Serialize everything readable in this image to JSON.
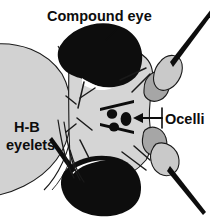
{
  "figure": {
    "type": "anatomical-diagram",
    "background_color": "#ffffff",
    "width": 210,
    "height": 218
  },
  "labels": {
    "compound_eye": "Compound eye",
    "ocelli": "Ocelli",
    "hb_eyelets_line1": "H-B",
    "hb_eyelets_line2": "eyelets"
  },
  "colors": {
    "black": "#0d0d0d",
    "outline": "#1a1a1a",
    "head_light_gray": "#d5d5d5",
    "body_gray": "#d2d2d2",
    "antenna_light": "#c9c9c9",
    "antenna_mid": "#a6a6a6",
    "white": "#ffffff"
  },
  "structures": [
    {
      "name": "posterior-head-mass",
      "fill": "#d2d2d2",
      "description": "large light gray rounded mass occupying the left portion"
    },
    {
      "name": "frons",
      "fill": "#d5d5d5",
      "description": "central light gray head plate between compound eyes"
    },
    {
      "name": "compound-eye-upper",
      "fill": "#0d0d0d",
      "description": "upper black compound eye blob"
    },
    {
      "name": "compound-eye-lower",
      "fill": "#0d0d0d",
      "description": "lower black compound eye blob"
    },
    {
      "name": "ocellus-dot-upper",
      "fill": "#0d0d0d"
    },
    {
      "name": "ocellus-dot-lower",
      "fill": "#0d0d0d"
    },
    {
      "name": "ocellus-dot-median",
      "fill": "#0d0d0d"
    },
    {
      "name": "antenna-upper-pedicel",
      "fill": "#a6a6a6"
    },
    {
      "name": "antenna-upper-funiculus",
      "fill": "#c9c9c9"
    },
    {
      "name": "antenna-upper-arista",
      "fill": "#0d0d0d"
    },
    {
      "name": "antenna-lower-pedicel",
      "fill": "#a6a6a6"
    },
    {
      "name": "antenna-lower-funiculus",
      "fill": "#c9c9c9"
    },
    {
      "name": "antenna-lower-arista",
      "fill": "#0d0d0d"
    }
  ],
  "annotations": {
    "compound_eye_leader": "line from Compound eye text down-left to upper black eye",
    "ocelli_leader": "horizontal line with left-pointing arrowhead from Ocelli text to the ocelli dots",
    "hb_eyelets_leader": "thick line from eyelets text down-right to eye margin"
  }
}
